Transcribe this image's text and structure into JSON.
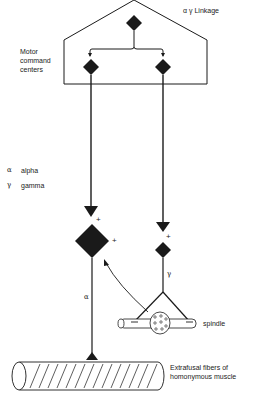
{
  "title": "α γ Linkage",
  "labels": {
    "linkage": "α γ Linkage",
    "motor_command_line1": "Motor",
    "motor_command_line2": "command",
    "motor_command_line3": "centers",
    "legend_alpha_symbol": "α",
    "legend_alpha_text": "alpha",
    "legend_gamma_symbol": "γ",
    "legend_gamma_text": "gamma",
    "alpha_axon": "α",
    "gamma_axon": "γ",
    "spindle": "spindle",
    "extrafusal_line1": "Extrafusal fibers of",
    "extrafusal_line2": "homonymous muscle",
    "plus": "+"
  },
  "colors": {
    "ink": "#1a1a1a",
    "background": "#ffffff"
  }
}
